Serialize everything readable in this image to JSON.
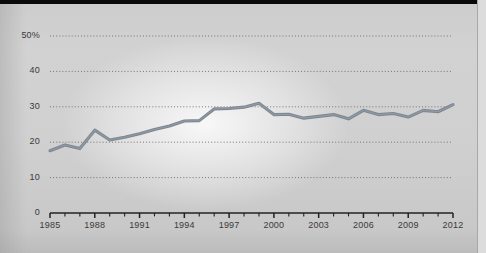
{
  "chart_data": {
    "type": "line",
    "title": "",
    "subtitle": "",
    "xlabel": "",
    "ylabel": "",
    "grid": true,
    "legend_position": "none",
    "xlim": [
      1985,
      2012
    ],
    "ylim": [
      0,
      50
    ],
    "y_ticks": [
      0,
      10,
      20,
      30,
      40,
      50
    ],
    "y_tick_labels": [
      "0",
      "10",
      "20",
      "30",
      "40",
      "50%"
    ],
    "x_ticks": [
      1985,
      1986,
      1987,
      1988,
      1989,
      1990,
      1991,
      1992,
      1993,
      1994,
      1995,
      1996,
      1997,
      1998,
      1999,
      2000,
      2001,
      2002,
      2003,
      2004,
      2005,
      2006,
      2007,
      2008,
      2009,
      2010,
      2011,
      2012
    ],
    "x_tick_labels": [
      "1985",
      "1988",
      "1991",
      "1994",
      "1997",
      "2000",
      "2003",
      "2006",
      "2009",
      "2012"
    ],
    "x_labeled_years": [
      1985,
      1988,
      1991,
      1994,
      1997,
      2000,
      2003,
      2006,
      2009,
      2012
    ],
    "series": [
      {
        "name": "series-1",
        "color": "#7d8791",
        "x": [
          1985,
          1986,
          1987,
          1988,
          1989,
          1990,
          1991,
          1992,
          1993,
          1994,
          1995,
          1996,
          1997,
          1998,
          1999,
          2000,
          2001,
          2002,
          2003,
          2004,
          2005,
          2006,
          2007,
          2008,
          2009,
          2010,
          2011,
          2012
        ],
        "values": [
          17.6,
          19.2,
          18.2,
          23.4,
          20.6,
          21.4,
          22.4,
          23.6,
          24.6,
          26.0,
          26.1,
          29.4,
          29.5,
          29.9,
          31.0,
          27.8,
          27.9,
          26.8,
          27.3,
          27.8,
          26.6,
          29.0,
          27.8,
          28.1,
          27.1,
          29.0,
          28.6,
          30.6
        ]
      }
    ]
  },
  "axis": {
    "y_labels": [
      "50%",
      "40",
      "30",
      "20",
      "10",
      "0"
    ],
    "x_labels": [
      "1985",
      "1988",
      "1991",
      "1994",
      "1997",
      "2000",
      "2003",
      "2006",
      "2009",
      "2012"
    ]
  },
  "colors": {
    "line": "#7d8791",
    "grid": "#6a6a6a",
    "axis": "#222222",
    "text": "#3a3a3a",
    "page": "#d0d0d0",
    "topbar": "#0a0a0a"
  }
}
